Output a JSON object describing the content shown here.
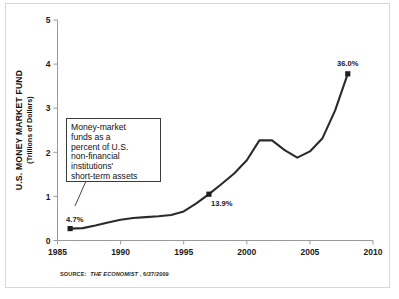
{
  "source_note": {
    "prefix": "SOURCE:",
    "publication": "THE ECONOMIST",
    "date": ", 6/27/2009",
    "full": "SOURCE: THE ECONOMIST, 6/27/2009"
  },
  "annotation": {
    "lines": [
      "Money-market",
      "funds as a",
      "percent of U.S.",
      "non-financial",
      "institutions'",
      "short-term assets"
    ]
  },
  "axis": {
    "y_title_line1": "U.S. MONEY MARKET FUND",
    "y_title_line2": "(Trillions of Dollars)"
  },
  "chart_data": {
    "type": "line",
    "title": "",
    "subtitle": "",
    "xlabel": "",
    "ylabel": "U.S. MONEY MARKET FUND (Trillions of Dollars)",
    "xlim": [
      1985,
      2010
    ],
    "ylim": [
      0,
      5
    ],
    "xticks": [
      1985,
      1990,
      1995,
      2000,
      2005,
      2010
    ],
    "xticklabels": [
      "1985",
      "1990",
      "1995",
      "2000",
      "2005",
      "2010"
    ],
    "yticks": [
      0,
      1,
      2,
      3,
      4,
      5
    ],
    "yticklabels": [
      "0",
      "1",
      "2",
      "3",
      "4",
      "5"
    ],
    "grid": false,
    "legend": false,
    "line_color": "#2b2b2b",
    "x": [
      1986,
      1987,
      1988,
      1989,
      1990,
      1991,
      1992,
      1993,
      1994,
      1995,
      1996,
      1997,
      1998,
      1999,
      2000,
      2001,
      2002,
      2003,
      2004,
      2005,
      2006,
      2007,
      2008
    ],
    "values": [
      0.27,
      0.28,
      0.34,
      0.41,
      0.47,
      0.51,
      0.53,
      0.55,
      0.58,
      0.66,
      0.84,
      1.05,
      1.28,
      1.52,
      1.82,
      2.27,
      2.27,
      2.05,
      1.88,
      2.02,
      2.32,
      2.95,
      3.78
    ],
    "markers": [
      {
        "x": 1986,
        "y": 0.27,
        "label": "4.7%"
      },
      {
        "x": 1997,
        "y": 1.05,
        "label": "13.9%"
      },
      {
        "x": 2008,
        "y": 3.78,
        "label": "36.0%"
      }
    ],
    "annotations": [
      {
        "text": "Money-market funds as a percent of U.S. non-financial institutions' short-term assets",
        "points_to": {
          "x": 1986,
          "y": 0.27
        }
      }
    ]
  }
}
